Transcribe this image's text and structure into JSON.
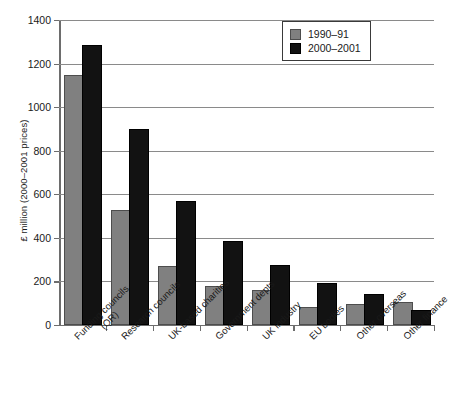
{
  "chart_data": {
    "type": "bar",
    "title": "",
    "xlabel": "",
    "ylabel": "£ million (2000–2001 prices)",
    "ylim": [
      0,
      1400
    ],
    "yticks": [
      0,
      200,
      400,
      600,
      800,
      1000,
      1200,
      1400
    ],
    "grid": true,
    "legend_position": "top-right",
    "categories": [
      "Funding councils (QR)",
      "Research councils",
      "UK-based charities",
      "Government depts",
      "UK industry",
      "EU bodies",
      "Other overseas",
      "Other finance"
    ],
    "category_lines": [
      [
        "Funding councils",
        "(QR)"
      ],
      [
        "Research councils"
      ],
      [
        "UK-based charities"
      ],
      [
        "Government depts"
      ],
      [
        "UK industry"
      ],
      [
        "EU bodies"
      ],
      [
        "Other overseas"
      ],
      [
        "Other finance"
      ]
    ],
    "series": [
      {
        "name": "1990–91",
        "color": "#808080",
        "values": [
          1140,
          520,
          262,
          172,
          152,
          74,
          88,
          96
        ]
      },
      {
        "name": "2000–2001",
        "color": "#121212",
        "values": [
          1278,
          892,
          558,
          378,
          266,
          182,
          132,
          62
        ]
      }
    ]
  },
  "legend": {
    "items": [
      {
        "label": "1990–91",
        "swatch": "series-0-swatch"
      },
      {
        "label": "2000–2001",
        "swatch": "series-1-swatch"
      }
    ]
  }
}
